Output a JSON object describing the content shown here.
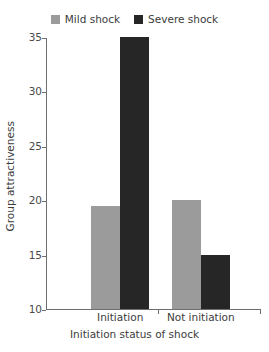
{
  "chart_data": {
    "type": "bar",
    "title": "",
    "subtitle": "",
    "xlabel": "Initiation status of shock",
    "ylabel": "Group attractiveness",
    "categories": [
      "Initiation",
      "Not initiation"
    ],
    "series": [
      {
        "name": "Mild shock",
        "color": "#9b9b9b",
        "values": [
          19.5,
          20
        ]
      },
      {
        "name": "Severe shock",
        "color": "#262626",
        "values": [
          35,
          15
        ]
      }
    ],
    "ylim": [
      10,
      35
    ],
    "yticks": [
      10,
      15,
      20,
      25,
      30,
      35
    ],
    "ytick_labels": [
      "10",
      "15",
      "20",
      "25",
      "30",
      "35"
    ],
    "grid": false,
    "legend_position": "top-center",
    "annotations": []
  },
  "legend": {
    "entries": [
      {
        "label": "Mild shock",
        "swatch_color": "#9b9b9b"
      },
      {
        "label": "Severe shock",
        "swatch_color": "#262626"
      }
    ]
  },
  "colors": {
    "mild": "#9b9b9b",
    "severe": "#262626",
    "axis": "#6e6e6e",
    "text": "#3c3c3c",
    "background": "#ffffff"
  }
}
